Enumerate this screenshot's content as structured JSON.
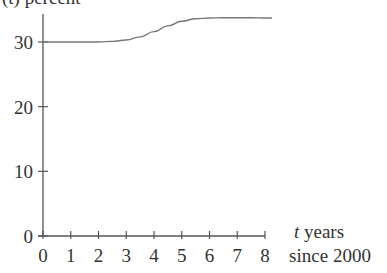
{
  "chart_data": {
    "type": "line",
    "title": "",
    "ylabel": "(t) percent",
    "xlabel_line1": "t years",
    "xlabel_line2": "since 2000",
    "xlabel": "t years since 2000",
    "xlim": [
      0,
      8
    ],
    "ylim": [
      0,
      35
    ],
    "grid": false,
    "legend": null,
    "x_ticks": [
      "0",
      "1",
      "2",
      "3",
      "4",
      "5",
      "6",
      "7",
      "8"
    ],
    "y_ticks": [
      "0",
      "10",
      "20",
      "30"
    ],
    "series": [
      {
        "name": "curve",
        "x": [
          0,
          0.5,
          1,
          1.5,
          2,
          2.5,
          3,
          3.5,
          4,
          4.5,
          5,
          5.5,
          6,
          6.5,
          7,
          7.5,
          8
        ],
        "y": [
          30,
          30,
          30,
          30,
          30,
          30.1,
          30.3,
          30.8,
          31.6,
          32.5,
          33.2,
          33.6,
          33.7,
          33.75,
          33.75,
          33.75,
          33.7
        ]
      }
    ]
  }
}
